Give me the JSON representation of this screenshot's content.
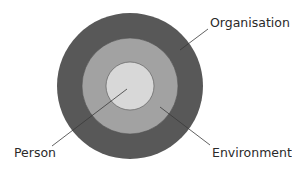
{
  "diagram": {
    "type": "concentric-circles",
    "rings": [
      {
        "id": "outer",
        "label": "Organisation",
        "color": "#585858",
        "cx": 130,
        "cy": 86,
        "r": 73
      },
      {
        "id": "middle",
        "label": "Environment",
        "color": "#a2a2a2",
        "cx": 130,
        "cy": 86,
        "r": 48
      },
      {
        "id": "inner",
        "label": "Person",
        "color": "#d8d8d8",
        "cx": 130,
        "cy": 86,
        "r": 24
      }
    ],
    "labels": {
      "organisation": "Organisation",
      "environment": "Environment",
      "person": "Person"
    },
    "line_color": "#3a3a3a",
    "stroke_color": "#4a4a4a"
  }
}
